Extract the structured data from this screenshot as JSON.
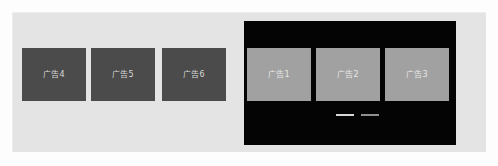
{
  "canvas": {
    "width": 498,
    "height": 166,
    "background_color": "#fdfdfd"
  },
  "light_panel": {
    "name": "light-backdrop-panel",
    "background_color": "#e4e4e4"
  },
  "dark_panel": {
    "name": "dark-overlay-panel",
    "background_color": "#040404"
  },
  "left_group": {
    "tile_color": "#4b4b4b",
    "label_color": "#d8d8d8",
    "tiles": [
      {
        "label": "广告4"
      },
      {
        "label": "广告5"
      },
      {
        "label": "广告6"
      }
    ]
  },
  "right_group": {
    "tile_color": "#a1a1a1",
    "label_color": "#e8e8e8",
    "tiles": [
      {
        "label": "广告1"
      },
      {
        "label": "广告2"
      },
      {
        "label": "广告3"
      }
    ]
  },
  "indicator_dashes": {
    "name": "indicator-dashes",
    "count": 2,
    "colors": [
      "#d6d6d6",
      "#8e8e8e"
    ]
  }
}
